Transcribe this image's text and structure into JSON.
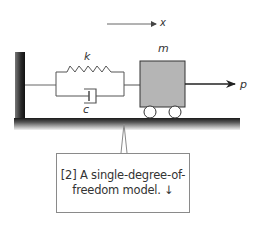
{
  "diagram": {
    "labels": {
      "displacement": "x",
      "stiffness": "k",
      "damping": "c",
      "mass": "m",
      "force": "p"
    },
    "colors": {
      "mass_fill": "#b5b5b5",
      "stroke": "#333333",
      "wall": "#2a2a2a",
      "line": "#666666"
    },
    "callout": {
      "line1": "[2] A single-degree-of-",
      "line2": "freedom model. ↓"
    }
  }
}
